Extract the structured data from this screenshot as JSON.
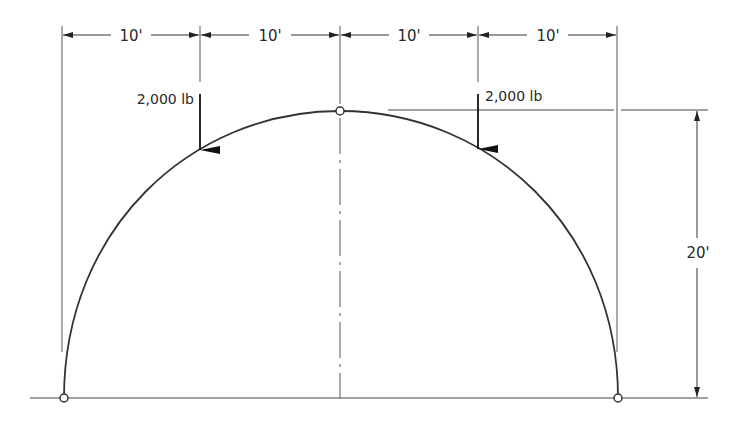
{
  "diagram": {
    "type": "three-hinged elliptical/semicircular arch with point loads",
    "colors": {
      "line": "#333333",
      "background": "#ffffff"
    },
    "span_dimensions": [
      {
        "label": "10'",
        "from_x": 62,
        "to_x": 200
      },
      {
        "label": "10'",
        "from_x": 200,
        "to_x": 340
      },
      {
        "label": "10'",
        "from_x": 340,
        "to_x": 478
      },
      {
        "label": "10'",
        "from_x": 478,
        "to_x": 617
      }
    ],
    "rise_dimension": {
      "label": "20'"
    },
    "loads": [
      {
        "label": "2,000 lb",
        "position": "left quarter point"
      },
      {
        "label": "2,000 lb",
        "position": "right quarter point"
      }
    ],
    "hinges": [
      {
        "name": "left-support-hinge"
      },
      {
        "name": "crown-hinge"
      },
      {
        "name": "right-support-hinge"
      }
    ]
  }
}
